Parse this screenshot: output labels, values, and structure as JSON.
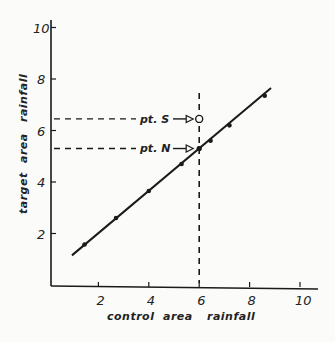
{
  "chart_data": {
    "type": "line",
    "title": "",
    "xlabel": "control area rainfall",
    "ylabel": "target area rainfall",
    "xlim": [
      0,
      10.8
    ],
    "ylim": [
      0,
      10.4
    ],
    "xticks": [
      2,
      4,
      6,
      8,
      10
    ],
    "yticks": [
      2,
      4,
      6,
      8,
      10
    ],
    "xtick_labels": [
      "2",
      "4",
      "6",
      "8",
      "10"
    ],
    "ytick_labels": [
      "2",
      "4",
      "6",
      "8",
      "10"
    ],
    "grid": false,
    "legend": null,
    "series": [
      {
        "name": "regression line",
        "style": "solid",
        "x": [
          0.95,
          8.85
        ],
        "y": [
          1.15,
          7.65
        ]
      },
      {
        "name": "observed points",
        "style": "markers",
        "x": [
          1.45,
          2.7,
          4.0,
          5.3,
          6.0,
          6.45,
          7.2,
          8.6
        ],
        "y": [
          1.57,
          2.6,
          3.65,
          4.7,
          5.3,
          5.6,
          6.2,
          7.35
        ]
      }
    ],
    "annotations": [
      {
        "label": "pt. S",
        "x": 6.0,
        "y": 6.45,
        "marker": "open-circle",
        "note": "seeded observation"
      },
      {
        "label": "pt. N",
        "x": 6.0,
        "y": 5.3,
        "marker": "filled-dot",
        "note": "predicted on line"
      }
    ],
    "reference_lines": [
      {
        "orientation": "vertical",
        "x": 6.0,
        "style": "dashed"
      },
      {
        "orientation": "horizontal",
        "y": 6.45,
        "style": "dashed",
        "to": "pt. S"
      },
      {
        "orientation": "horizontal",
        "y": 5.3,
        "style": "dashed",
        "to": "pt. N"
      }
    ]
  },
  "labels": {
    "xlabel_words": [
      "control",
      "area",
      "rainfall"
    ],
    "ylabel_words": [
      "target",
      "area",
      "rainfall"
    ],
    "pt_s": "pt. S",
    "pt_n": "pt. N"
  }
}
